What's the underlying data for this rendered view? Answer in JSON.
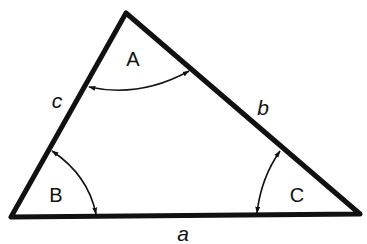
{
  "diagram": {
    "colors": {
      "stroke": "#111111",
      "background": "#ffffff"
    },
    "vertices": {
      "A": {
        "x": 126,
        "y": 13
      },
      "B": {
        "x": 11,
        "y": 217
      },
      "C": {
        "x": 360,
        "y": 214
      }
    },
    "angles": [
      {
        "name": "A",
        "label": "A",
        "x": 133,
        "y": 66
      },
      {
        "name": "B",
        "label": "B",
        "x": 56,
        "y": 202
      },
      {
        "name": "C",
        "label": "C",
        "x": 297,
        "y": 202
      }
    ],
    "sides": [
      {
        "name": "a",
        "label": "a",
        "x": 183,
        "y": 241,
        "between": "B-C"
      },
      {
        "name": "b",
        "label": "b",
        "x": 263,
        "y": 115,
        "between": "A-C"
      },
      {
        "name": "c",
        "label": "c",
        "x": 57,
        "y": 108,
        "between": "A-B"
      }
    ]
  }
}
